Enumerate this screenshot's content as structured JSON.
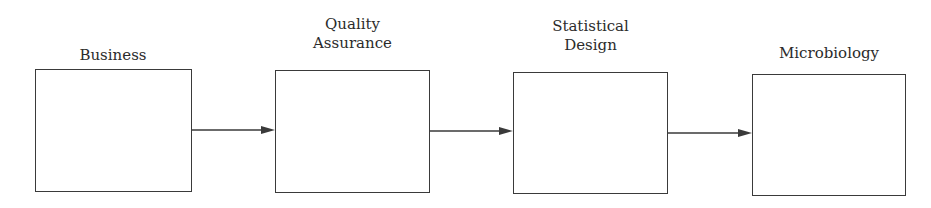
{
  "diagram": {
    "type": "flowchart",
    "direction": "left-to-right",
    "nodes": [
      {
        "id": "business",
        "label_lines": [
          "Business"
        ]
      },
      {
        "id": "quality-assurance",
        "label_lines": [
          "Quality",
          "Assurance"
        ]
      },
      {
        "id": "statistical-design",
        "label_lines": [
          "Statistical",
          "Design"
        ]
      },
      {
        "id": "microbiology",
        "label_lines": [
          "Microbiology"
        ]
      }
    ],
    "edges": [
      {
        "from": "business",
        "to": "quality-assurance"
      },
      {
        "from": "quality-assurance",
        "to": "statistical-design"
      },
      {
        "from": "statistical-design",
        "to": "microbiology"
      }
    ],
    "colors": {
      "stroke": "#3a3a3a",
      "text": "#2b2b2b",
      "background": "#ffffff"
    }
  }
}
